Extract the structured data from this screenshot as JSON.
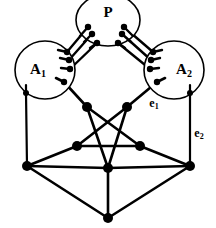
{
  "figure": {
    "background_color": "#ffffff",
    "stroke_color": "#000000",
    "width": 216,
    "height": 228
  },
  "blobs": [
    {
      "id": "P",
      "label": "P",
      "subscript": "",
      "cx": 108,
      "cy": 20,
      "rx": 32,
      "ry": 26,
      "label_x": 108,
      "label_y": 14
    },
    {
      "id": "A1",
      "label": "A",
      "subscript": "1",
      "cx": 45,
      "cy": 70,
      "rx": 30,
      "ry": 29,
      "label_x": 38,
      "label_y": 71
    },
    {
      "id": "A2",
      "label": "A",
      "subscript": "2",
      "cx": 174,
      "cy": 70,
      "rx": 30,
      "ry": 29,
      "label_x": 184,
      "label_y": 71
    }
  ],
  "edge_labels": [
    {
      "id": "e1",
      "label": "e",
      "subscript": "1",
      "x": 154,
      "y": 104
    },
    {
      "id": "e2",
      "label": "e",
      "subscript": "2",
      "x": 199,
      "y": 134
    }
  ],
  "ports": {
    "P_left": [
      {
        "x": 88,
        "y": 27
      },
      {
        "x": 92,
        "y": 34
      },
      {
        "x": 97,
        "y": 43
      }
    ],
    "P_right": [
      {
        "x": 124,
        "y": 27
      },
      {
        "x": 122,
        "y": 34
      },
      {
        "x": 118,
        "y": 43
      }
    ],
    "A1_right": [
      {
        "x": 67,
        "y": 52
      },
      {
        "x": 69,
        "y": 60
      },
      {
        "x": 70,
        "y": 69
      },
      {
        "x": 64,
        "y": 82
      }
    ],
    "A1_bottom": [
      {
        "x": 26,
        "y": 93
      }
    ],
    "A2_left": [
      {
        "x": 153,
        "y": 52
      },
      {
        "x": 151,
        "y": 60
      },
      {
        "x": 150,
        "y": 69
      },
      {
        "x": 157,
        "y": 82
      }
    ],
    "A2_bottom": [
      {
        "x": 190,
        "y": 93
      }
    ]
  },
  "nodes": [
    {
      "id": "n_upper_left",
      "x": 87,
      "y": 107
    },
    {
      "id": "n_upper_right",
      "x": 127,
      "y": 107
    },
    {
      "id": "n_mid_left",
      "x": 77,
      "y": 146
    },
    {
      "id": "n_mid_right",
      "x": 140,
      "y": 146
    },
    {
      "id": "n_star_bottom",
      "x": 108,
      "y": 168
    },
    {
      "id": "n_corner_left",
      "x": 27,
      "y": 166
    },
    {
      "id": "n_corner_right",
      "x": 190,
      "y": 166
    },
    {
      "id": "n_bottom",
      "x": 108,
      "y": 218
    }
  ],
  "multi_edges": [
    {
      "from": "A1_right.0",
      "to": "P_left.0",
      "x1": 67,
      "y1": 52,
      "x2": 88,
      "y2": 27
    },
    {
      "from": "A1_right.1",
      "to": "P_left.1",
      "x1": 69,
      "y1": 60,
      "x2": 92,
      "y2": 34
    },
    {
      "from": "A1_right.2",
      "to": "P_left.2",
      "x1": 70,
      "y1": 69,
      "x2": 97,
      "y2": 43
    },
    {
      "from": "A2_left.0",
      "to": "P_right.0",
      "x1": 153,
      "y1": 52,
      "x2": 124,
      "y2": 27
    },
    {
      "from": "A2_left.1",
      "to": "P_right.1",
      "x1": 151,
      "y1": 60,
      "x2": 122,
      "y2": 34
    },
    {
      "from": "A2_left.2",
      "to": "P_right.2",
      "x1": 150,
      "y1": 69,
      "x2": 118,
      "y2": 43
    }
  ],
  "edges": [
    {
      "id": "A1-upperleft",
      "x1": 64,
      "y1": 82,
      "x2": 87,
      "y2": 107
    },
    {
      "id": "A2-upperright",
      "x1": 157,
      "y1": 82,
      "x2": 127,
      "y2": 107
    },
    {
      "id": "A1-cornerleft",
      "x1": 26,
      "y1": 93,
      "x2": 27,
      "y2": 166
    },
    {
      "id": "A2-cornerright",
      "x1": 190,
      "y1": 93,
      "x2": 190,
      "y2": 166
    },
    {
      "id": "star-ul-to-mr",
      "x1": 87,
      "y1": 107,
      "x2": 140,
      "y2": 146
    },
    {
      "id": "star-ur-to-ml",
      "x1": 127,
      "y1": 107,
      "x2": 77,
      "y2": 146
    },
    {
      "id": "star-ul-to-sb",
      "x1": 87,
      "y1": 107,
      "x2": 108,
      "y2": 168
    },
    {
      "id": "star-ur-to-sb",
      "x1": 127,
      "y1": 107,
      "x2": 108,
      "y2": 168
    },
    {
      "id": "star-ml-to-mr",
      "x1": 77,
      "y1": 146,
      "x2": 140,
      "y2": 146
    },
    {
      "id": "ml-to-cornerleft",
      "x1": 77,
      "y1": 146,
      "x2": 27,
      "y2": 166
    },
    {
      "id": "mr-to-cornerright",
      "x1": 140,
      "y1": 146,
      "x2": 190,
      "y2": 166
    },
    {
      "id": "cornerleft-to-sb",
      "x1": 27,
      "y1": 166,
      "x2": 108,
      "y2": 168
    },
    {
      "id": "cornerright-to-sb",
      "x1": 190,
      "y1": 166,
      "x2": 108,
      "y2": 168
    },
    {
      "id": "sb-to-bottom",
      "x1": 108,
      "y1": 168,
      "x2": 108,
      "y2": 218
    },
    {
      "id": "cornerleft-to-bottom",
      "x1": 27,
      "y1": 166,
      "x2": 108,
      "y2": 218
    },
    {
      "id": "cornerright-to-bottom",
      "x1": 190,
      "y1": 166,
      "x2": 108,
      "y2": 218
    }
  ]
}
